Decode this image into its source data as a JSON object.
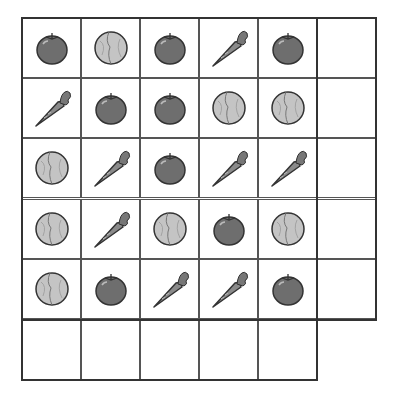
{
  "puzzle": {
    "grid_rows": 6,
    "grid_cols": 6,
    "rows": [
      [
        "tomato",
        "cabbage",
        "tomato",
        "carrot",
        "tomato",
        "empty"
      ],
      [
        "carrot",
        "tomato",
        "tomato",
        "cabbage",
        "cabbage",
        "empty"
      ],
      [
        "cabbage",
        "carrot",
        "tomato",
        "carrot",
        "carrot",
        "empty"
      ],
      [
        "cabbage",
        "carrot",
        "cabbage",
        "tomato",
        "cabbage",
        "empty"
      ],
      [
        "cabbage",
        "tomato",
        "carrot",
        "carrot",
        "tomato",
        "empty"
      ],
      [
        "empty",
        "empty",
        "empty",
        "empty",
        "empty",
        "none"
      ]
    ],
    "colors": {
      "tomato": "#6e6e6e",
      "cabbage": "#c4c4c4",
      "carrot": "#8a8a8a",
      "leaf": "#777777",
      "outline": "#333333",
      "grid": "#555555"
    }
  }
}
